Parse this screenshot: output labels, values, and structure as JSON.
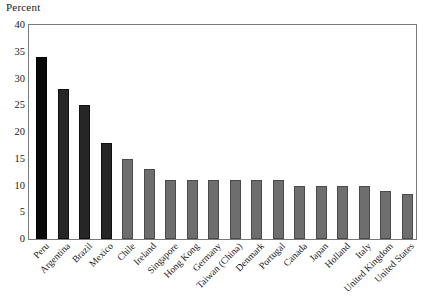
{
  "chart_data": {
    "type": "bar",
    "title": "",
    "subtitle": "",
    "xlabel": "",
    "ylabel": "Percent",
    "ylim": [
      0,
      40
    ],
    "yticks": [
      0,
      5,
      10,
      15,
      20,
      25,
      30,
      35,
      40
    ],
    "ytick_labels": [
      "0",
      "5",
      "10",
      "15",
      "20",
      "25",
      "30",
      "35",
      "40"
    ],
    "grid": false,
    "legend": "none",
    "categories": [
      "Peru",
      "Argentina",
      "Brazil",
      "Mexico",
      "Chile",
      "Ireland",
      "Singapore",
      "Hong Kong",
      "Germany",
      "Taiwan (China)",
      "Denmark",
      "Portugal",
      "Canada",
      "Japan",
      "Holland",
      "Italy",
      "United Kingdom",
      "United States"
    ],
    "values": [
      34.1,
      28.0,
      25.0,
      18.0,
      15.0,
      13.0,
      11.0,
      11.0,
      11.0,
      11.0,
      11.0,
      11.0,
      10.0,
      10.0,
      10.0,
      10.0,
      9.0,
      8.5
    ],
    "bar_styles": [
      "black",
      "dark",
      "dark",
      "dark",
      "gray",
      "gray",
      "gray",
      "gray",
      "gray",
      "gray",
      "gray",
      "gray",
      "gray",
      "gray",
      "gray",
      "gray",
      "gray",
      "gray"
    ],
    "colors": {
      "black_bar": "#080808",
      "dark_bar": "#262626",
      "gray_bar": "#6e6e6e",
      "frame": "#7a7a7a",
      "text": "#1a1a1a",
      "background": "#ffffff"
    }
  }
}
